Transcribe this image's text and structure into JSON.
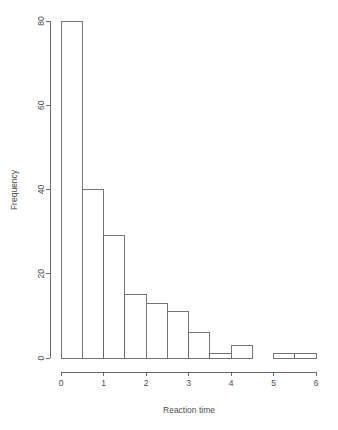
{
  "chart_data": {
    "type": "bar",
    "title": "",
    "subtitle": "",
    "xlabel": "Reaction time",
    "ylabel": "Frequency",
    "bin_width": 0.5,
    "bin_edges": [
      0,
      0.5,
      1.0,
      1.5,
      2.0,
      2.5,
      3.0,
      3.5,
      4.0,
      4.5,
      5.0,
      5.5,
      6.0
    ],
    "categories": [
      "0-0.5",
      "0.5-1",
      "1-1.5",
      "1.5-2",
      "2-2.5",
      "2.5-3",
      "3-3.5",
      "3.5-4",
      "4-4.5",
      "4.5-5",
      "5-5.5",
      "5.5-6"
    ],
    "values": [
      80,
      40,
      29,
      15,
      13,
      11,
      6,
      1,
      3,
      0,
      1,
      1
    ],
    "xlim": [
      0,
      6
    ],
    "ylim": [
      0,
      80
    ],
    "xticks": [
      0,
      1,
      2,
      3,
      4,
      5,
      6
    ],
    "xtick_labels": [
      "0",
      "1",
      "2",
      "3",
      "4",
      "5",
      "6"
    ],
    "yticks": [
      0,
      20,
      40,
      60,
      80
    ],
    "ytick_labels": [
      "0",
      "20",
      "40",
      "60",
      "80"
    ],
    "grid": false,
    "legend": null,
    "bar_fill_color": "#ffffff",
    "bar_stroke_color": "#666666",
    "axis_color": "#5a5a5a",
    "background_color": "#ffffff"
  }
}
